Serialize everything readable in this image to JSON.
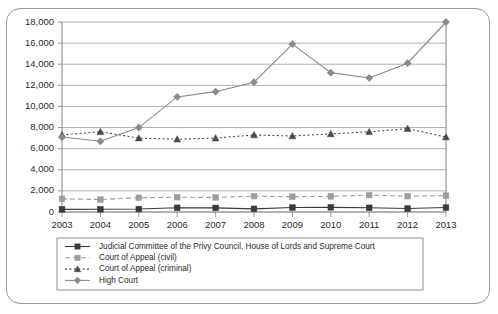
{
  "chart_data": {
    "type": "line",
    "title": "",
    "subtitle": "",
    "xlabel": "",
    "ylabel": "",
    "grid": true,
    "legend_position": "bottom",
    "categories": [
      "2003",
      "2004",
      "2005",
      "2006",
      "2007",
      "2008",
      "2009",
      "2010",
      "2011",
      "2012",
      "2013"
    ],
    "x": [
      2003,
      2004,
      2005,
      2006,
      2007,
      2008,
      2009,
      2010,
      2011,
      2012,
      2013
    ],
    "ylim": [
      0,
      18000
    ],
    "yticks": [
      0,
      2000,
      4000,
      6000,
      8000,
      10000,
      12000,
      14000,
      16000,
      18000
    ],
    "ytick_labels": [
      "0",
      "2,000",
      "4,000",
      "6,000",
      "8,000",
      "10,000",
      "12,000",
      "14,000",
      "16,000",
      "18,000"
    ],
    "series": [
      {
        "name": "Judicial Committee of the Privy Council, House of Lords and Supreme Court",
        "marker": "square",
        "line_style": "solid",
        "color": "#3a3a3a",
        "values": [
          250,
          260,
          280,
          400,
          390,
          300,
          420,
          440,
          400,
          330,
          420
        ]
      },
      {
        "name": "Court of Appeal (civil)",
        "marker": "square",
        "line_style": "dashed",
        "color": "#9d9d9d",
        "values": [
          1250,
          1180,
          1350,
          1400,
          1380,
          1500,
          1450,
          1480,
          1600,
          1500,
          1550
        ]
      },
      {
        "name": "Court of Appeal (criminal)",
        "marker": "triangle",
        "line_style": "dotted",
        "color": "#4a4a4a",
        "values": [
          7300,
          7600,
          7000,
          6900,
          7000,
          7300,
          7200,
          7400,
          7600,
          7900,
          7100
        ]
      },
      {
        "name": "High Court",
        "marker": "diamond",
        "line_style": "solid",
        "color": "#8a8a8a",
        "values": [
          7100,
          6700,
          8000,
          10900,
          11400,
          12300,
          15900,
          13200,
          12700,
          14100,
          18000
        ]
      }
    ]
  },
  "legend": {
    "entries": [
      {
        "label": "Judicial Committee of the Privy Council, House of Lords and Supreme Court"
      },
      {
        "label": "Court of Appeal (civil)"
      },
      {
        "label": "Court of Appeal (criminal)"
      },
      {
        "label": "High Court"
      }
    ]
  }
}
